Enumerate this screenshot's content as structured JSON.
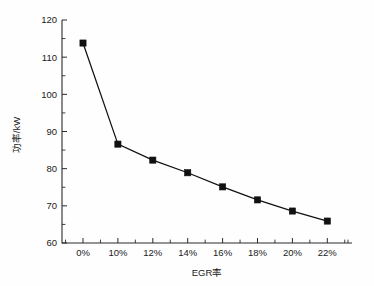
{
  "chart_data": {
    "type": "line",
    "title": "",
    "xlabel": "EGR率",
    "ylabel": "功率/kW",
    "categories": [
      "0%",
      "10%",
      "12%",
      "14%",
      "16%",
      "18%",
      "20%",
      "22%"
    ],
    "x_tick_labels": [
      "0%",
      "10%",
      "12%",
      "14%",
      "16%",
      "18%",
      "20%",
      "22%"
    ],
    "y_tick_labels": [
      "60",
      "70",
      "80",
      "90",
      "100",
      "110",
      "120"
    ],
    "y_ticks": [
      60,
      70,
      80,
      90,
      100,
      110,
      120
    ],
    "y_minor_ticks": [
      65,
      75,
      85,
      95,
      105,
      115
    ],
    "ylim": [
      60,
      120
    ],
    "values": [
      113.8,
      86.6,
      82.3,
      78.9,
      75.1,
      71.6,
      68.6,
      65.9
    ],
    "series": [
      {
        "name": "功率",
        "values": [
          113.8,
          86.6,
          82.3,
          78.9,
          75.1,
          71.6,
          68.6,
          65.9
        ]
      }
    ],
    "grid": false,
    "legend": false,
    "legend_position": "none",
    "marker": "square",
    "marker_color": "#111111",
    "line_color": "#111111",
    "axis_color": "#2a2a2a",
    "background_color": "#fefefe"
  },
  "axes": {
    "y_axis_label": "功率/kW",
    "x_axis_label": "EGR率"
  }
}
